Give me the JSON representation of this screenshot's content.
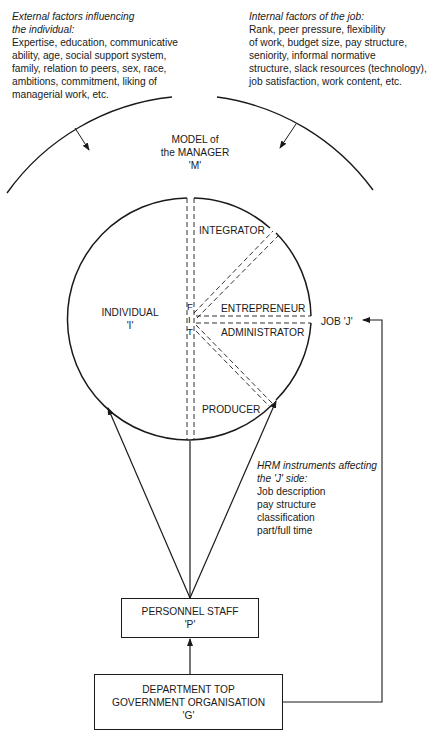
{
  "external_factors": {
    "heading_line1": "External factors influencing",
    "heading_line2": "the individual:",
    "lines": [
      "Expertise, education, communicative",
      "ability, age, social support system,",
      "family, relation to peers, sex, race,",
      "ambitions, commitment, liking of",
      "managerial work, etc."
    ]
  },
  "internal_factors": {
    "heading": "Internal factors of the job:",
    "lines": [
      "Rank, peer pressure, flexibility",
      "of work, budget size, pay structure,",
      "seniority, informal normative",
      "structure, slack resources (technology),",
      "job satisfaction, work content, etc."
    ]
  },
  "model": {
    "line1": "MODEL of",
    "line2": "the MANAGER",
    "line3": "'M'"
  },
  "circle": {
    "individual_label": "INDIVIDUAL",
    "individual_symbol": "'I'",
    "fit_f": "F",
    "fit_i": "I",
    "fit_t": "T",
    "roles": {
      "integrator": "INTEGRATOR",
      "entrepreneur": "ENTREPRENEUR",
      "administrator": "ADMINISTRATOR",
      "producer": "PRODUCER"
    }
  },
  "job": {
    "label": "JOB 'J'"
  },
  "hrm_instruments": {
    "heading_line1": "HRM instruments affecting",
    "heading_line2": "the 'J' side:",
    "items": [
      "Job description",
      "pay structure",
      "classification",
      "part/full time"
    ]
  },
  "personnel_box": {
    "line1": "PERSONNEL STAFF",
    "line2": "'P'"
  },
  "department_box": {
    "line1": "DEPARTMENT TOP",
    "line2": "GOVERNMENT ORGANISATION",
    "line3": "'G'"
  },
  "colors": {
    "ink": "#1a1a1a",
    "background": "#ffffff"
  }
}
